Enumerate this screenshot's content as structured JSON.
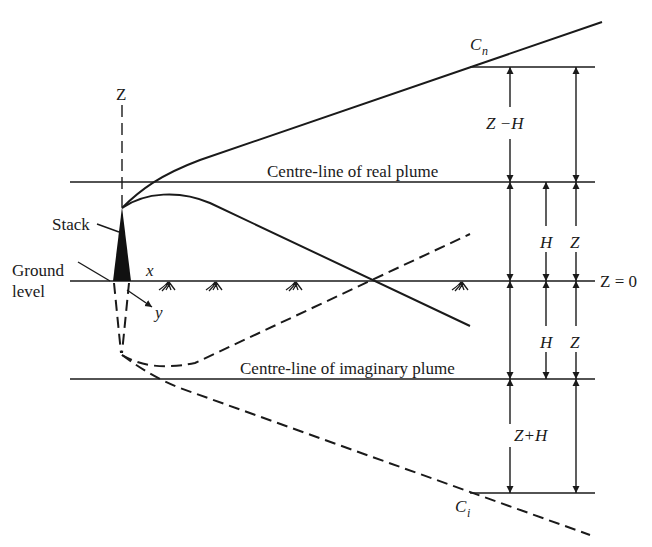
{
  "diagram": {
    "type": "image-source method for plume reflection at ground",
    "axes": {
      "z_label": "Z",
      "x_label": "x",
      "y_label": "y"
    },
    "labels": {
      "stack": "Stack",
      "ground_line1": "Ground",
      "ground_line2": "level",
      "real_centreline": "Centre-line of real plume",
      "imaginary_centreline": "Centre-line of imaginary plume",
      "cn_main": "C",
      "cn_sub": "n",
      "ci_main": "C",
      "ci_sub": "i",
      "z_zero": "Z = 0",
      "z_minus_h": "Z −H",
      "z_plus_h": "Z+H",
      "h_upper": "H",
      "z_upper": "Z",
      "h_lower": "H",
      "z_lower": "Z"
    },
    "colors": {
      "ink": "#1a1a1a",
      "background": "#ffffff"
    }
  }
}
